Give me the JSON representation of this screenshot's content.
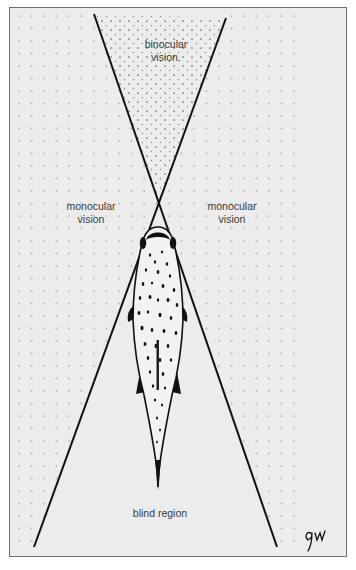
{
  "figure": {
    "labels": {
      "binocular": [
        "binocular",
        "vision."
      ],
      "monocular_left": [
        "monocular",
        "vision"
      ],
      "monocular_right": [
        "monocular",
        "vision"
      ],
      "blind": "blind region"
    },
    "signature": "gw",
    "colors": {
      "background": "#ececec",
      "line": "#111111",
      "dot": "#8a8a8a",
      "frame": "#6f6f6f"
    },
    "geometry": {
      "left_sight_line": [
        [
          94,
          14
        ],
        [
          277,
          547
        ]
      ],
      "right_sight_line": [
        [
          226,
          18
        ],
        [
          34,
          547
        ]
      ],
      "crossing_point": [
        159,
        205
      ],
      "dot_spacing": 12.5
    }
  }
}
